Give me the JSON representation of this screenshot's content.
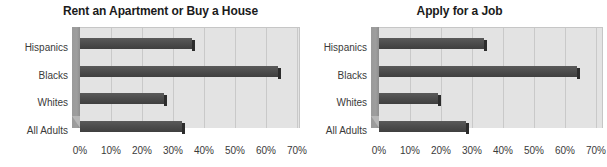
{
  "chart_data": [
    {
      "type": "bar",
      "orientation": "horizontal",
      "title": "Rent an Apartment or Buy a House",
      "categories": [
        "Hispanics",
        "Blacks",
        "Whites",
        "All Adults"
      ],
      "values": [
        36,
        64,
        27,
        33
      ],
      "xlabel": "",
      "ylabel": "",
      "xlim": [
        0,
        70
      ],
      "xticks": [
        0,
        10,
        20,
        30,
        40,
        50,
        60,
        70
      ],
      "xticklabels": [
        "0%",
        "10%",
        "20%",
        "30%",
        "40%",
        "50%",
        "60%",
        "70%"
      ],
      "grid": "vertical",
      "legend": "none",
      "bar_color": "#4d4d4d",
      "plot_bg": "#e3e3e3"
    },
    {
      "type": "bar",
      "orientation": "horizontal",
      "title": "Apply for a Job",
      "categories": [
        "Hispanics",
        "Blacks",
        "Whites",
        "All Adults"
      ],
      "values": [
        34,
        64,
        19,
        28
      ],
      "xlabel": "",
      "ylabel": "",
      "xlim": [
        0,
        70
      ],
      "xticks": [
        0,
        10,
        20,
        30,
        40,
        50,
        60,
        70
      ],
      "xticklabels": [
        "0%",
        "10%",
        "20%",
        "30%",
        "40%",
        "50%",
        "60%",
        "70%"
      ],
      "grid": "vertical",
      "legend": "none",
      "bar_color": "#4d4d4d",
      "plot_bg": "#e3e3e3"
    }
  ],
  "panels": [
    {
      "title": "Rent an Apartment or Buy a House",
      "categories": [
        "Hispanics",
        "Blacks",
        "Whites",
        "All Adults"
      ],
      "ticks": [
        "0%",
        "10%",
        "20%",
        "30%",
        "40%",
        "50%",
        "60%",
        "70%"
      ]
    },
    {
      "title": "Apply for a Job",
      "categories": [
        "Hispanics",
        "Blacks",
        "Whites",
        "All Adults"
      ],
      "ticks": [
        "0%",
        "10%",
        "20%",
        "30%",
        "40%",
        "50%",
        "60%",
        "70%"
      ]
    }
  ],
  "colors": {
    "bar": "#4d4d4d",
    "bar_cap": "#2c2c2c",
    "plot_bg": "#e3e3e3",
    "gridline": "#c9c9c9",
    "wall": "#9a9a9a",
    "floor": "#b7b7b7",
    "text": "#3a3a3a",
    "title": "#1b1b1b"
  }
}
